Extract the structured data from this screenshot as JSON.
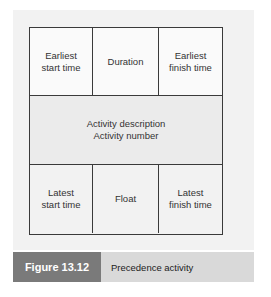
{
  "diagram": {
    "top_row": [
      "Earliest\nstart time",
      "Duration",
      "Earliest\nfinish time"
    ],
    "middle": {
      "line1": "Activity description",
      "line2": "Activity number"
    },
    "bottom_row": [
      "Latest\nstart time",
      "Float",
      "Latest\nfinish time"
    ]
  },
  "caption": {
    "label": "Figure 13.12",
    "title": "Precedence activity"
  },
  "colors": {
    "panel_bg": "#f2f2f2",
    "border": "#3a3a3a",
    "caption_label_bg": "#7a7a7a",
    "caption_title_bg": "#d9d9d9"
  }
}
